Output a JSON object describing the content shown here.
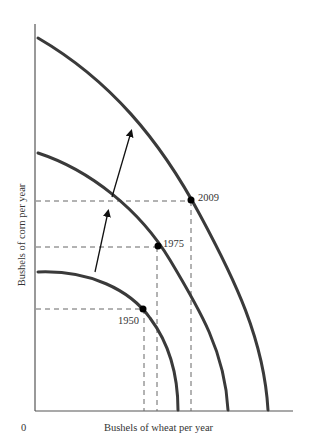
{
  "figure": {
    "type": "production-possibilities-frontier",
    "x_axis_label": "Bushels of wheat per year",
    "y_axis_label": "Bushels of corn per year",
    "origin_label": "0",
    "colors": {
      "curve": "#3a3a3a",
      "axis": "#555555",
      "dashed": "#666666",
      "point": "#000000",
      "text": "#333333"
    },
    "frontiers": [
      {
        "name": "ppf-1950",
        "year": "1950",
        "point_label": "1950"
      },
      {
        "name": "ppf-1975",
        "year": "1975",
        "point_label": "1975"
      },
      {
        "name": "ppf-2009",
        "year": "2009",
        "point_label": "2009"
      }
    ],
    "arrows": [
      {
        "name": "shift-arrow-1950-1975",
        "from": "1950",
        "to": "1975"
      },
      {
        "name": "shift-arrow-1975-2009",
        "from": "1975",
        "to": "2009"
      }
    ]
  }
}
